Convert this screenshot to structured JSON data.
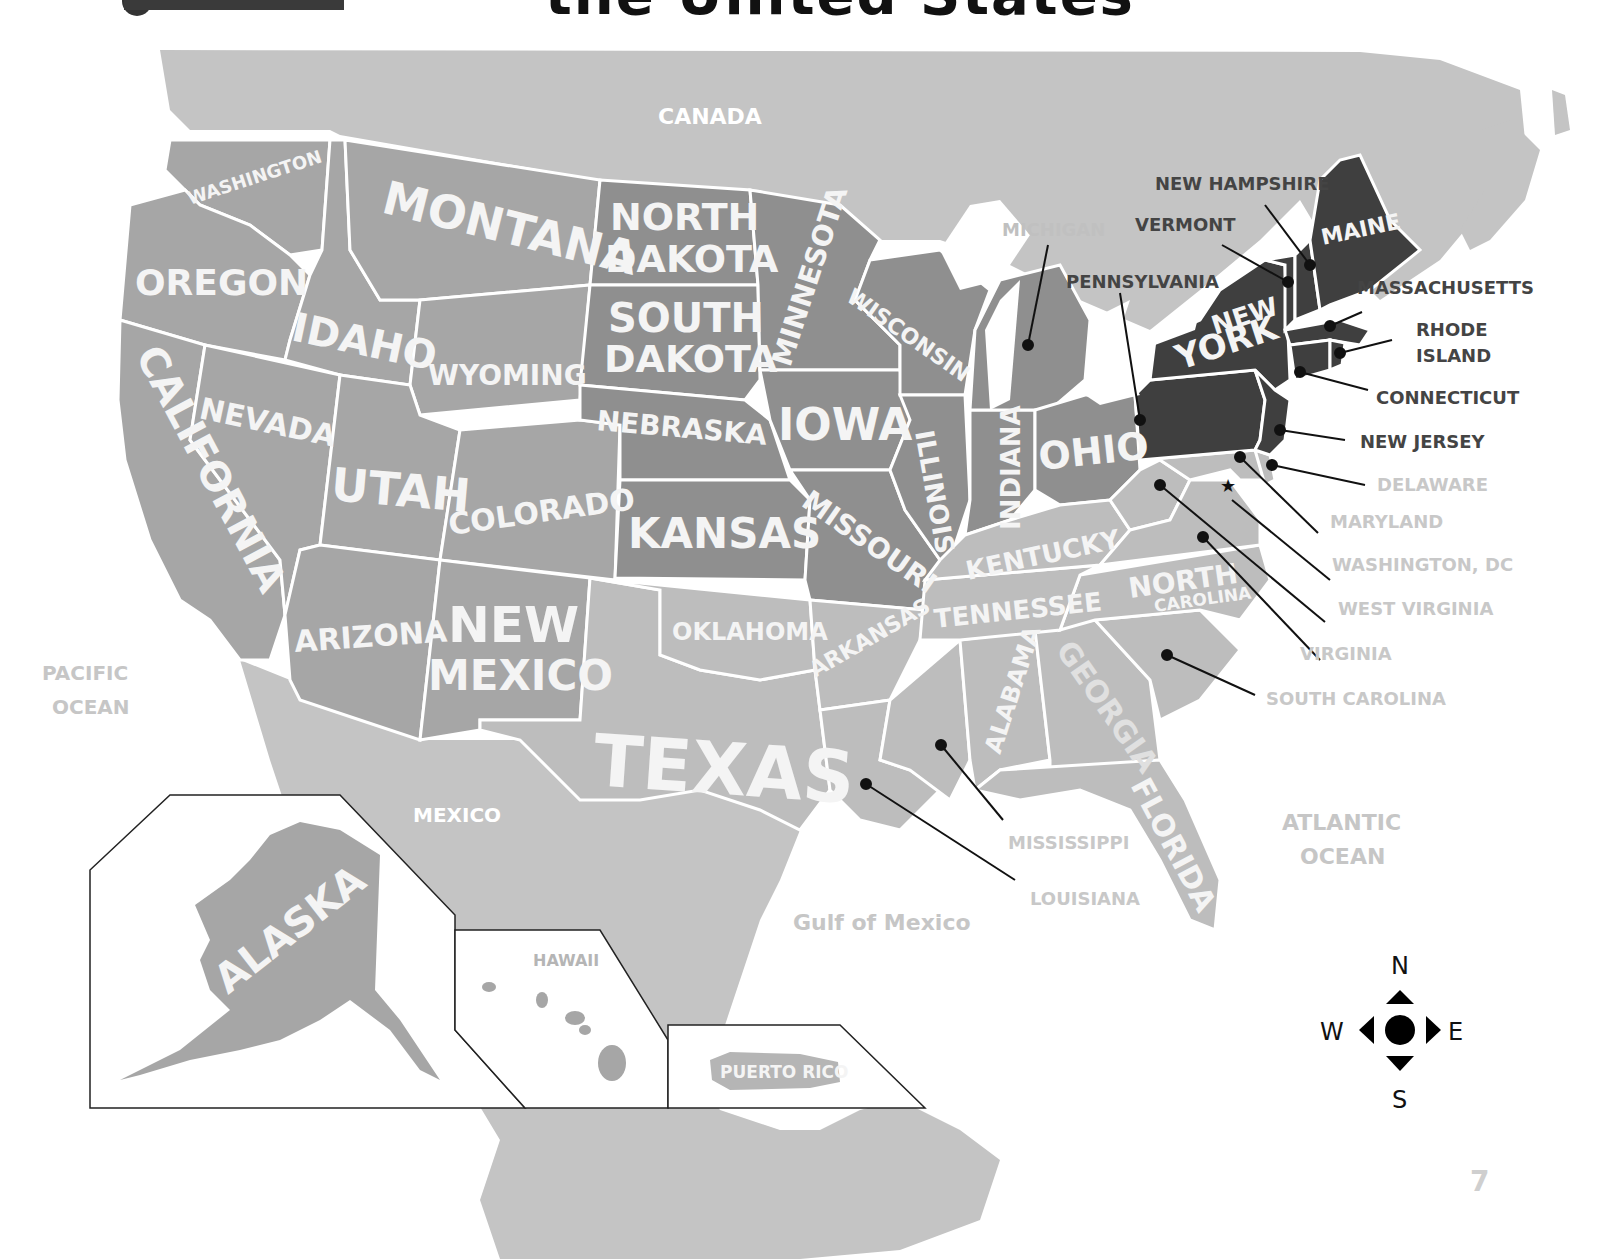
{
  "page": {
    "title_fragment": "the United States",
    "page_number": "7"
  },
  "regions": {
    "canada": "CANADA",
    "mexico": "MEXICO",
    "pacific_ocean": [
      "PACIFIC",
      "OCEAN"
    ],
    "atlantic_ocean": [
      "ATLANTIC",
      "OCEAN"
    ],
    "gulf_of_mexico": "Gulf of Mexico"
  },
  "states": {
    "washington": "WASHINGTON",
    "oregon": "OREGON",
    "california": "CALIFORNIA",
    "idaho": "IDAHO",
    "nevada": "NEVADA",
    "montana": "MONTANA",
    "wyoming": "WYOMING",
    "utah": "UTAH",
    "arizona": "ARIZONA",
    "colorado": "COLORADO",
    "new_mexico": [
      "NEW",
      "MEXICO"
    ],
    "north_dakota": [
      "NORTH",
      "DAKOTA"
    ],
    "south_dakota": [
      "SOUTH",
      "DAKOTA"
    ],
    "nebraska": "NEBRASKA",
    "kansas": "KANSAS",
    "oklahoma": "OKLAHOMA",
    "texas": "TEXAS",
    "minnesota": "MINNESOTA",
    "iowa": "IOWA",
    "missouri": "MISSOURI",
    "arkansas": "ARKANSAS",
    "wisconsin": "WISCONSIN",
    "illinois": "ILLINOIS",
    "indiana": "INDIANA",
    "ohio": "OHIO",
    "kentucky": "KENTUCKY",
    "tennessee": "TENNESSEE",
    "alabama": "ALABAMA",
    "georgia": "GEORGIA",
    "florida": "FLORIDA",
    "north_carolina": [
      "NORTH",
      "CAROLINA"
    ],
    "new_york": [
      "NEW",
      "YORK"
    ],
    "maine": "MAINE",
    "alaska": "ALASKA",
    "hawaii": "HAWAII",
    "puerto_rico": "PUERTO RICO"
  },
  "callouts": {
    "michigan": "MICHIGAN",
    "new_hampshire": "NEW HAMPSHIRE",
    "vermont": "VERMONT",
    "pennsylvania": "PENNSYLVANIA",
    "massachusetts": "MASSACHUSETTS",
    "rhode_island": [
      "RHODE",
      "ISLAND"
    ],
    "connecticut": "CONNECTICUT",
    "new_jersey": "NEW JERSEY",
    "delaware": "DELAWARE",
    "maryland": "MARYLAND",
    "washington_dc": "WASHINGTON, DC",
    "west_virginia": "WEST VIRGINIA",
    "virginia": "VIRGINIA",
    "south_carolina": "SOUTH CAROLINA",
    "mississippi": "MISSISSIPPI",
    "louisiana": "LOUISIANA"
  },
  "compass": {
    "north": "N",
    "south": "S",
    "east": "E",
    "west": "W"
  },
  "colors": {
    "west_fill": "#a6a6a6",
    "plains_fill": "#8f8f8f",
    "south_fill": "#bdbdbd",
    "northeast_fill": "#3f3f3f",
    "foreign_fill": "#c4c4c4",
    "border": "#ffffff"
  }
}
